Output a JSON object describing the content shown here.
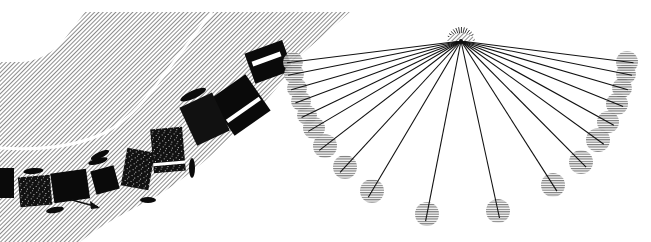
{
  "figure": {
    "width": 651,
    "height": 242,
    "background": "#ffffff",
    "left_panel": {
      "description": "Hatched curved road band with a white center curve and a sequence of dark tumbling object silhouettes moving along it, ending with an arrow",
      "hatch_color": "#8a8a8a",
      "silhouette_color": "#0a0a0a",
      "arrow": {
        "x1": 72,
        "y1": 200,
        "x2": 100,
        "y2": 208
      }
    },
    "right_panel": {
      "description": "Pendulum-like fan of lines radiating from a pivot point to a semicircle of hatched circular bobs",
      "pivot": {
        "x": 461,
        "y": 41
      },
      "line_color": "#111111",
      "bob_color": "#808080",
      "bobs": [
        {
          "x": 293,
          "y": 62,
          "r": 10
        },
        {
          "x": 294,
          "y": 74,
          "r": 10
        },
        {
          "x": 297,
          "y": 88,
          "r": 10
        },
        {
          "x": 301,
          "y": 101,
          "r": 10
        },
        {
          "x": 307,
          "y": 115,
          "r": 10
        },
        {
          "x": 314,
          "y": 128,
          "r": 11
        },
        {
          "x": 325,
          "y": 146,
          "r": 12
        },
        {
          "x": 345,
          "y": 167,
          "r": 12
        },
        {
          "x": 372,
          "y": 191,
          "r": 12
        },
        {
          "x": 427,
          "y": 214,
          "r": 12
        },
        {
          "x": 498,
          "y": 211,
          "r": 12
        },
        {
          "x": 553,
          "y": 185,
          "r": 12
        },
        {
          "x": 581,
          "y": 162,
          "r": 12
        },
        {
          "x": 598,
          "y": 140,
          "r": 12
        },
        {
          "x": 608,
          "y": 122,
          "r": 11
        },
        {
          "x": 617,
          "y": 104,
          "r": 11
        },
        {
          "x": 622,
          "y": 88,
          "r": 10
        },
        {
          "x": 626,
          "y": 74,
          "r": 10
        },
        {
          "x": 627,
          "y": 62,
          "r": 11
        }
      ]
    }
  }
}
